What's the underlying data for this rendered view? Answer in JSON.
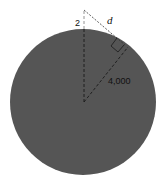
{
  "diagram": {
    "labels": {
      "height": "2",
      "distance": "d",
      "radius": "4,000"
    },
    "colors": {
      "circle_fill": "#555555",
      "background": "#ffffff",
      "line": "#111111",
      "dashed_line_on_white": "#777777"
    }
  }
}
